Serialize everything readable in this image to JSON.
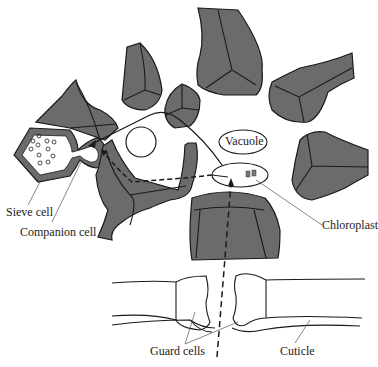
{
  "diagram": {
    "title": "",
    "type": "biology cross-section: pathway from stoma through mesophyll to phloem",
    "labels": {
      "vacuole": "Vacuole",
      "chloroplast": "Chloroplast",
      "sieve_cell": "Sieve cell",
      "companion_cell": "Companion cell",
      "guard_cells": "Guard cells",
      "cuticle": "Cuticle"
    },
    "colors": {
      "cell_fill": "#6b6b6b",
      "outline": "#1a1a1a",
      "background": "#ffffff"
    },
    "arrows": [
      {
        "name": "co2-entry-path",
        "style": "dashed",
        "from": "stoma",
        "to": "chloroplast"
      },
      {
        "name": "sugar-transport-path",
        "style": "solid",
        "from": "chloroplast-cell",
        "to": "companion-cell"
      },
      {
        "name": "apoplast-path",
        "style": "dashed",
        "from": "chloroplast-cell",
        "to": "companion-cell"
      }
    ]
  }
}
